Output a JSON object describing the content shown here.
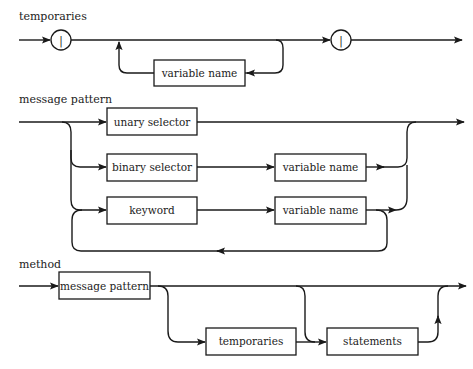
{
  "diagrams": {
    "temporaries": {
      "title": "temporaries",
      "terminal_open": "|",
      "terminal_close": "|",
      "loop_box": "variable name"
    },
    "message_pattern": {
      "title": "message pattern",
      "unary_box": "unary selector",
      "binary_box": "binary selector",
      "binary_arg_box": "variable name",
      "keyword_box": "keyword",
      "keyword_arg_box": "variable name"
    },
    "method": {
      "title": "method",
      "pattern_box": "message pattern",
      "temporaries_box": "temporaries",
      "statements_box": "statements"
    }
  }
}
